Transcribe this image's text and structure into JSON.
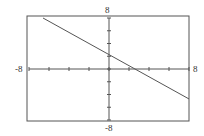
{
  "chart_data": {
    "type": "line",
    "title": "",
    "xlabel": "",
    "ylabel": "",
    "xlim": [
      -8,
      8
    ],
    "ylim": [
      -8,
      8
    ],
    "grid": false,
    "tick_spacing": 2,
    "tick_labels": {
      "x_min": "-8",
      "x_max": "8",
      "y_min": "-8",
      "y_max": "8"
    },
    "series": [
      {
        "name": "line",
        "x": [
          -6.6,
          8
        ],
        "y": [
          8,
          -4.7
        ],
        "approx_equation": "y = -0.87x + 2.3"
      }
    ]
  }
}
